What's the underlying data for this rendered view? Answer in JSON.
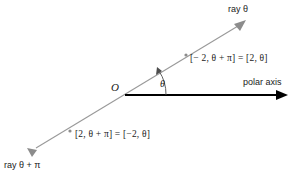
{
  "figure": {
    "background_color": "#ffffff",
    "ray_color": "#999999",
    "axis_color": "#000000",
    "text_color": "#1a1a1a",
    "labels": {
      "ray_theta": "ray θ",
      "ray_theta_plus_pi": "ray θ + π",
      "polar_axis": "polar axis",
      "origin": "O",
      "angle": "θ",
      "upper_point": "[− 2, θ + π] = [2, θ]",
      "lower_point": "[2, θ + π] = [−2, θ]"
    },
    "geometry": {
      "origin_x": 124,
      "origin_y": 95,
      "ray_upper_end_x": 244,
      "ray_upper_end_y": 22,
      "ray_lower_end_x": 30,
      "ray_lower_end_y": 152,
      "axis_end_x": 287,
      "axis_end_y": 95,
      "upper_marker_x": 186,
      "upper_marker_y": 55,
      "lower_marker_x": 70,
      "lower_marker_y": 131,
      "angle_degrees": 31
    }
  }
}
